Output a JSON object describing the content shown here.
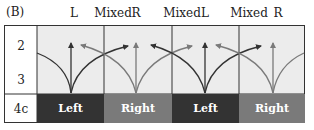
{
  "panel_label": "(B)",
  "column_headers": [
    {
      "label": "L",
      "x": 74
    },
    {
      "label": "Mixed",
      "x": 118
    },
    {
      "label": "R",
      "x": 136
    },
    {
      "label": "Mixed",
      "x": 186
    },
    {
      "label": "L",
      "x": 205
    },
    {
      "label": "Mixed",
      "x": 253
    },
    {
      "label": "R",
      "x": 277
    }
  ],
  "row_labels": [
    "2",
    "3",
    "4c"
  ],
  "bottom_cells": [
    {
      "label": "Left",
      "color": "#333333"
    },
    {
      "label": "Right",
      "color": "#7a7a7a"
    },
    {
      "label": "Left",
      "color": "#333333"
    },
    {
      "label": "Right",
      "color": "#7a7a7a"
    }
  ],
  "colors": {
    "dark": "#333333",
    "gray": "#7a7a7a",
    "grid_bg": "#ececec"
  }
}
